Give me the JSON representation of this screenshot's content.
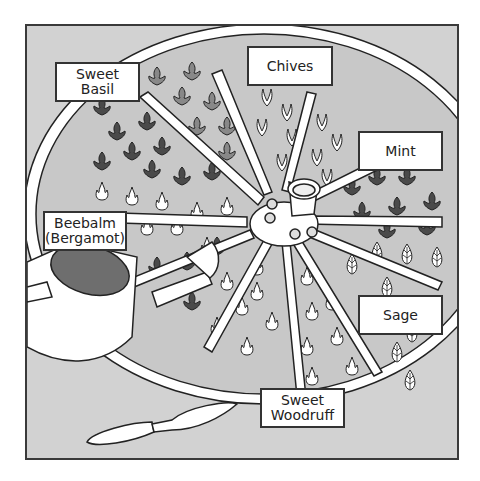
{
  "illustration": {
    "subject": "Wagon wheel herb garden",
    "labels": [
      {
        "id": "sweet-basil",
        "text": "Sweet\nBasil"
      },
      {
        "id": "chives",
        "text": "Chives"
      },
      {
        "id": "mint",
        "text": "Mint"
      },
      {
        "id": "beebalm",
        "text": "Beebalm\n(Bergamot)"
      },
      {
        "id": "sage",
        "text": "Sage"
      },
      {
        "id": "sweet-woodruff",
        "text": "Sweet\nWoodruff"
      }
    ],
    "objects": [
      "wagon-wheel",
      "watering-can",
      "trowel"
    ],
    "colors": {
      "background": "#d2d2d2",
      "frame": "#3a3a3a",
      "plant_dark": "#4a4a4a",
      "plant_mid": "#8a8a8a",
      "wheel": "#ffffff",
      "can_interior": "#6e6e6e"
    }
  }
}
